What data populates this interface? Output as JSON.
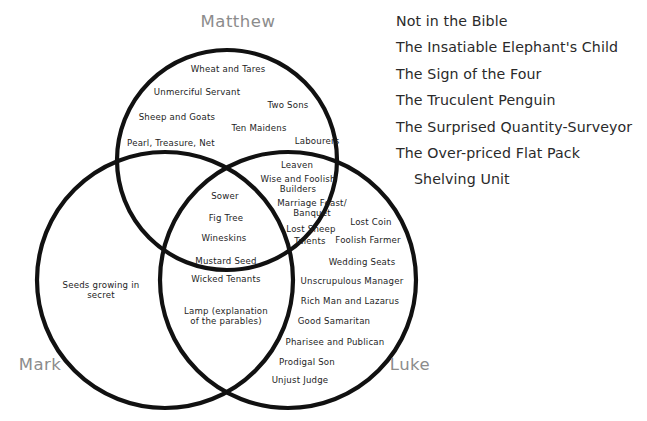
{
  "diagram": {
    "type": "venn-3-circle",
    "title_labels": {
      "matthew": "Matthew",
      "mark": "Mark",
      "luke": "Luke"
    },
    "label_color": "#8c8c8c",
    "stroke_color": "#111111",
    "background": "#ffffff",
    "regions": {
      "matthew_only": [
        {
          "text": "Wheat and Tares",
          "x": 228,
          "y": 69
        },
        {
          "text": "Unmerciful Servant",
          "x": 197,
          "y": 92
        },
        {
          "text": "Two Sons",
          "x": 288,
          "y": 105
        },
        {
          "text": "Sheep and Goats",
          "x": 177,
          "y": 117
        },
        {
          "text": "Ten Maidens",
          "x": 259,
          "y": 128
        },
        {
          "text": "Pearl, Treasure, Net",
          "x": 171,
          "y": 143
        },
        {
          "text": "Labourers",
          "x": 317,
          "y": 141
        }
      ],
      "matthew_luke": [
        {
          "text": "Leaven",
          "x": 297,
          "y": 165
        },
        {
          "text": "Wise and Foolish\nBuilders",
          "x": 298,
          "y": 184
        },
        {
          "text": "Marriage Feast/\nBanquet",
          "x": 312,
          "y": 208
        },
        {
          "text": "Lost Sheep",
          "x": 311,
          "y": 229
        },
        {
          "text": "Talents",
          "x": 310,
          "y": 241
        }
      ],
      "all_three": [
        {
          "text": "Sower",
          "x": 225,
          "y": 196
        },
        {
          "text": "Fig Tree",
          "x": 226,
          "y": 218
        },
        {
          "text": "Wineskins",
          "x": 224,
          "y": 238
        },
        {
          "text": "Mustard Seed",
          "x": 226,
          "y": 261
        },
        {
          "text": "Wicked Tenants",
          "x": 226,
          "y": 279
        }
      ],
      "mark_only": [
        {
          "text": "Seeds growing in\nsecret",
          "x": 101,
          "y": 290
        }
      ],
      "mark_luke": [
        {
          "text": "Lamp (explanation\nof the parables)",
          "x": 226,
          "y": 316
        }
      ],
      "luke_only": [
        {
          "text": "Lost Coin",
          "x": 371,
          "y": 222
        },
        {
          "text": "Foolish Farmer",
          "x": 368,
          "y": 240
        },
        {
          "text": "Wedding Seats",
          "x": 362,
          "y": 262
        },
        {
          "text": "Unscrupulous Manager",
          "x": 352,
          "y": 281
        },
        {
          "text": "Rich Man and Lazarus",
          "x": 350,
          "y": 301
        },
        {
          "text": "Good Samaritan",
          "x": 334,
          "y": 321
        },
        {
          "text": "Pharisee and Publican",
          "x": 335,
          "y": 342
        },
        {
          "text": "Prodigal Son",
          "x": 307,
          "y": 362
        },
        {
          "text": "Unjust Judge",
          "x": 300,
          "y": 380
        }
      ]
    }
  },
  "aside": {
    "lines": [
      {
        "text": "Not in the Bible",
        "indent": false
      },
      {
        "text": "The Insatiable Elephant's Child",
        "indent": false
      },
      {
        "text": "The Sign of the Four",
        "indent": false
      },
      {
        "text": "The Truculent Penguin",
        "indent": false
      },
      {
        "text": "The Surprised Quantity-Surveyor",
        "indent": false
      },
      {
        "text": "The Over-priced Flat Pack",
        "indent": false
      },
      {
        "text": "Shelving Unit",
        "indent": true
      }
    ]
  }
}
